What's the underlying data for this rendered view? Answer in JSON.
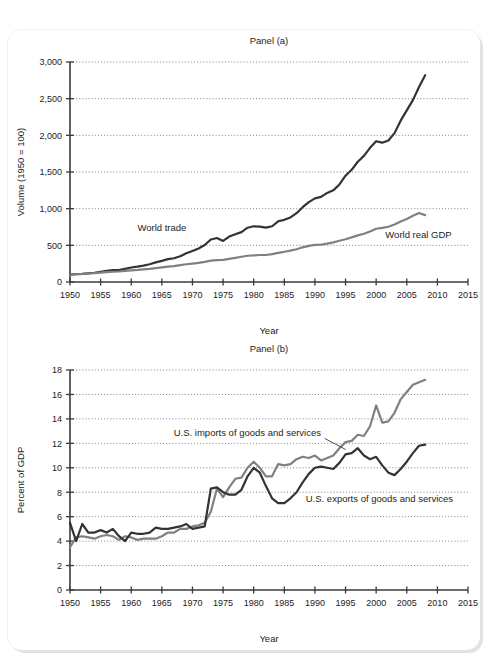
{
  "figure": {
    "background_color": "#ffffff",
    "card_color": "#ffffff",
    "shadow_color": "#e2e2e2"
  },
  "colors": {
    "dark_series": "#333333",
    "light_series": "#808080",
    "axis": "#3a3a3a",
    "grid": "#6f6f8a",
    "text": "#1c1c1c"
  },
  "chart_data": [
    {
      "id": "panel-a",
      "type": "line",
      "title": "Panel (a)",
      "xlabel": "Year",
      "ylabel": "Volume (1950 = 100)",
      "xlim": [
        1950,
        2015
      ],
      "ylim": [
        0,
        3000
      ],
      "xticks": [
        1950,
        1955,
        1960,
        1965,
        1970,
        1975,
        1980,
        1985,
        1990,
        1995,
        2000,
        2005,
        2010,
        2015
      ],
      "xticklabels": [
        "1950",
        "1955",
        "1960",
        "1965",
        "1970",
        "1975",
        "1980",
        "1985",
        "1990",
        "1995",
        "2000",
        "2005",
        "2010",
        "2015"
      ],
      "yticks": [
        0,
        500,
        1000,
        1500,
        2000,
        2500,
        3000
      ],
      "yticklabels": [
        "0",
        "500",
        "1,000",
        "1,500",
        "2,000",
        "2,500",
        "3,000"
      ],
      "grid": "horizontal-dotted",
      "legend": "inline-annotations",
      "series": [
        {
          "name": "World trade",
          "color": "#333333",
          "width": 2.2,
          "label_x": 1969.0,
          "label_y": 700,
          "label_anchor": "end",
          "x": [
            1950,
            1951,
            1952,
            1953,
            1954,
            1955,
            1956,
            1957,
            1958,
            1959,
            1960,
            1961,
            1962,
            1963,
            1964,
            1965,
            1966,
            1967,
            1968,
            1969,
            1970,
            1971,
            1972,
            1973,
            1974,
            1975,
            1976,
            1977,
            1978,
            1979,
            1980,
            1981,
            1982,
            1983,
            1984,
            1985,
            1986,
            1987,
            1988,
            1989,
            1990,
            1991,
            1992,
            1993,
            1994,
            1995,
            1996,
            1997,
            1998,
            1999,
            2000,
            2001,
            2002,
            2003,
            2004,
            2005,
            2006,
            2007,
            2008
          ],
          "y": [
            100,
            108,
            110,
            118,
            126,
            140,
            152,
            162,
            162,
            180,
            198,
            210,
            224,
            242,
            268,
            288,
            312,
            324,
            352,
            392,
            424,
            456,
            504,
            580,
            600,
            560,
            620,
            650,
            680,
            740,
            760,
            755,
            742,
            760,
            828,
            848,
            880,
            938,
            1020,
            1090,
            1140,
            1160,
            1215,
            1250,
            1330,
            1450,
            1530,
            1640,
            1720,
            1830,
            1920,
            1900,
            1930,
            2030,
            2200,
            2340,
            2480,
            2660,
            2820
          ]
        },
        {
          "name": "World real GDP",
          "color": "#808080",
          "width": 2.2,
          "label_x": 2001.5,
          "label_y": 600,
          "label_anchor": "start",
          "x": [
            1950,
            1951,
            1952,
            1953,
            1954,
            1955,
            1956,
            1957,
            1958,
            1959,
            1960,
            1961,
            1962,
            1963,
            1964,
            1965,
            1966,
            1967,
            1968,
            1969,
            1970,
            1971,
            1972,
            1973,
            1974,
            1975,
            1976,
            1977,
            1978,
            1979,
            1980,
            1981,
            1982,
            1983,
            1984,
            1985,
            1986,
            1987,
            1988,
            1989,
            1990,
            1991,
            1992,
            1993,
            1994,
            1995,
            1996,
            1997,
            1998,
            1999,
            2000,
            2001,
            2002,
            2003,
            2004,
            2005,
            2006,
            2007,
            2008
          ],
          "y": [
            100,
            106,
            110,
            116,
            120,
            128,
            134,
            140,
            143,
            151,
            158,
            164,
            172,
            180,
            190,
            200,
            210,
            217,
            229,
            242,
            251,
            261,
            275,
            291,
            297,
            301,
            316,
            329,
            344,
            358,
            362,
            368,
            368,
            380,
            398,
            412,
            428,
            447,
            473,
            492,
            506,
            510,
            524,
            540,
            562,
            583,
            608,
            636,
            658,
            688,
            726,
            738,
            754,
            784,
            824,
            860,
            902,
            940,
            912
          ]
        }
      ]
    },
    {
      "id": "panel-b",
      "type": "line",
      "title": "Panel (b)",
      "xlabel": "Year",
      "ylabel": "Percent of GDP",
      "xlim": [
        1950,
        2015
      ],
      "ylim": [
        0,
        18
      ],
      "xticks": [
        1950,
        1955,
        1960,
        1965,
        1970,
        1975,
        1980,
        1985,
        1990,
        1995,
        2000,
        2005,
        2010,
        2015
      ],
      "xticklabels": [
        "1950",
        "1955",
        "1960",
        "1965",
        "1970",
        "1975",
        "1980",
        "1985",
        "1990",
        "1995",
        "2000",
        "2005",
        "2010",
        "2015"
      ],
      "yticks": [
        0,
        2,
        4,
        6,
        8,
        10,
        12,
        14,
        16,
        18
      ],
      "yticklabels": [
        "0",
        "2",
        "4",
        "6",
        "8",
        "10",
        "12",
        "14",
        "16",
        "18"
      ],
      "grid": "horizontal-dotted",
      "legend": "inline-annotations",
      "series": [
        {
          "name": "U.S. imports of goods and services",
          "color": "#808080",
          "width": 2.2,
          "label_x": 1991.0,
          "label_y": 12.6,
          "label_anchor": "end",
          "leader": [
            [
              1991.6,
              12.4
            ],
            [
              1995.0,
              11.5
            ]
          ],
          "x": [
            1950,
            1951,
            1952,
            1953,
            1954,
            1955,
            1956,
            1957,
            1958,
            1959,
            1960,
            1961,
            1962,
            1963,
            1964,
            1965,
            1966,
            1967,
            1968,
            1969,
            1970,
            1971,
            1972,
            1973,
            1974,
            1975,
            1976,
            1977,
            1978,
            1979,
            1980,
            1981,
            1982,
            1983,
            1984,
            1985,
            1986,
            1987,
            1988,
            1989,
            1990,
            1991,
            1992,
            1993,
            1994,
            1995,
            1996,
            1997,
            1998,
            1999,
            2000,
            2001,
            2002,
            2003,
            2004,
            2005,
            2006,
            2007,
            2008
          ],
          "y": [
            3.5,
            4.3,
            4.4,
            4.3,
            4.2,
            4.4,
            4.5,
            4.4,
            4.1,
            4.4,
            4.3,
            4.1,
            4.2,
            4.2,
            4.2,
            4.4,
            4.7,
            4.7,
            5.0,
            5.0,
            5.2,
            5.3,
            5.5,
            6.4,
            8.3,
            7.6,
            8.4,
            9.1,
            9.2,
            10.0,
            10.5,
            10.0,
            9.3,
            9.3,
            10.3,
            10.2,
            10.3,
            10.7,
            10.9,
            10.8,
            11.0,
            10.6,
            10.8,
            11.0,
            11.6,
            12.1,
            12.2,
            12.7,
            12.6,
            13.4,
            15.1,
            13.7,
            13.8,
            14.5,
            15.6,
            16.2,
            16.8,
            17.0,
            17.2
          ]
        },
        {
          "name": "U.S. exports of goods and services",
          "color": "#333333",
          "width": 2.2,
          "label_x": 1988.5,
          "label_y": 7.2,
          "label_anchor": "start",
          "x": [
            1950,
            1951,
            1952,
            1953,
            1954,
            1955,
            1956,
            1957,
            1958,
            1959,
            1960,
            1961,
            1962,
            1963,
            1964,
            1965,
            1966,
            1967,
            1968,
            1969,
            1970,
            1971,
            1972,
            1973,
            1974,
            1975,
            1976,
            1977,
            1978,
            1979,
            1980,
            1981,
            1982,
            1983,
            1984,
            1985,
            1986,
            1987,
            1988,
            1989,
            1990,
            1991,
            1992,
            1993,
            1994,
            1995,
            1996,
            1997,
            1998,
            1999,
            2000,
            2001,
            2002,
            2003,
            2004,
            2005,
            2006,
            2007,
            2008
          ],
          "y": [
            5.5,
            4.0,
            5.4,
            4.7,
            4.7,
            4.9,
            4.7,
            5.0,
            4.4,
            4.0,
            4.7,
            4.6,
            4.6,
            4.7,
            5.1,
            5.0,
            5.0,
            5.1,
            5.2,
            5.4,
            5.0,
            5.1,
            5.2,
            8.3,
            8.4,
            8.0,
            7.8,
            7.8,
            8.2,
            9.3,
            10.0,
            9.6,
            8.5,
            7.5,
            7.1,
            7.1,
            7.5,
            8.0,
            8.8,
            9.5,
            10.0,
            10.1,
            10.0,
            9.9,
            10.4,
            11.1,
            11.2,
            11.6,
            11.0,
            10.7,
            10.9,
            10.2,
            9.6,
            9.4,
            9.9,
            10.5,
            11.2,
            11.8,
            11.9
          ]
        }
      ]
    }
  ]
}
